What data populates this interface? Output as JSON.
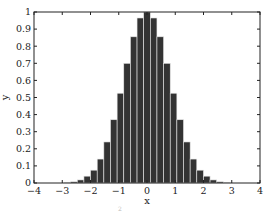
{
  "chart_data": {
    "type": "bar",
    "title": "",
    "xlabel": "x",
    "ylabel": "y",
    "xlim": [
      -4,
      4
    ],
    "ylim": [
      0,
      1
    ],
    "xticks": [
      -4,
      -3,
      -2,
      -1,
      0,
      1,
      2,
      3,
      4
    ],
    "xtick_labels": [
      "−4",
      "−3",
      "−2",
      "−1",
      "0",
      "1",
      "2",
      "3",
      "4"
    ],
    "yticks": [
      0,
      0.1,
      0.2,
      0.3,
      0.4,
      0.5,
      0.6,
      0.7,
      0.8,
      0.9,
      1
    ],
    "ytick_labels": [
      "0",
      "0.1",
      "0.2",
      "0.3",
      "0.4",
      "0.5",
      "0.6",
      "0.7",
      "0.8",
      "0.9",
      "1"
    ],
    "grid": false,
    "legend": null,
    "bin_width": 0.235,
    "x": [
      -2.82,
      -2.585,
      -2.35,
      -2.115,
      -1.88,
      -1.645,
      -1.41,
      -1.175,
      -0.94,
      -0.705,
      -0.47,
      -0.235,
      0,
      0.235,
      0.47,
      0.705,
      0.94,
      1.175,
      1.41,
      1.645,
      1.88,
      2.115,
      2.35,
      2.585,
      2.82
    ],
    "values": [
      0.003,
      0.007,
      0.018,
      0.04,
      0.075,
      0.14,
      0.24,
      0.37,
      0.525,
      0.7,
      0.855,
      0.965,
      1.0,
      0.965,
      0.855,
      0.7,
      0.525,
      0.37,
      0.24,
      0.14,
      0.075,
      0.04,
      0.018,
      0.007,
      0.003
    ],
    "bar_color": "#333333",
    "bar_edge_color": "#e6e6e6"
  },
  "caption_fragment": "2"
}
